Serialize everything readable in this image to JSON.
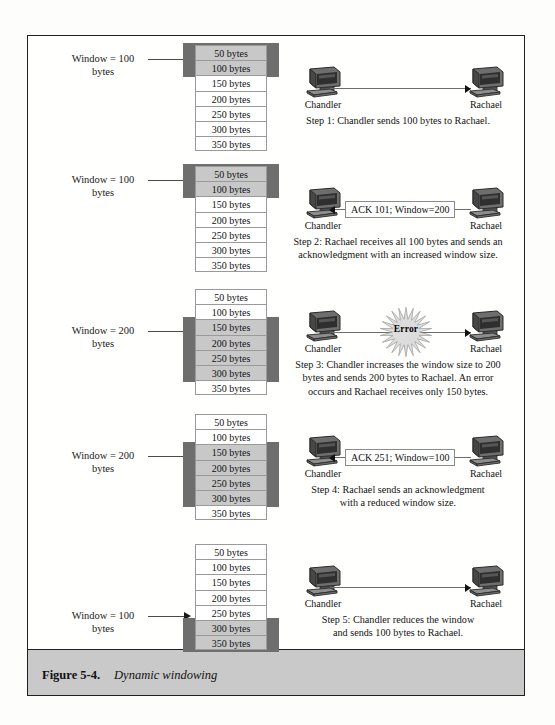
{
  "figure": {
    "number": "Figure 5-4.",
    "title": "Dynamic windowing"
  },
  "hosts": {
    "sender": "Chandler",
    "receiver": "Rachael"
  },
  "byte_cells": [
    "50 bytes",
    "100 bytes",
    "150 bytes",
    "200 bytes",
    "250 bytes",
    "300 bytes",
    "350 bytes"
  ],
  "colors": {
    "window_band": "#6e6e6e",
    "highlighted_cell": "#c8c8c8",
    "caption_band": "#c9c9c9",
    "border": "#231f20"
  },
  "steps": [
    {
      "id": 1,
      "window_label_line1": "Window = 100",
      "window_label_line2": "bytes",
      "window_bytes": 100,
      "highlight_rows": [
        1,
        2
      ],
      "direction": "right",
      "message": "",
      "error": false,
      "caption_lines": [
        "Step 1: Chandler sends 100 bytes to Rachael."
      ]
    },
    {
      "id": 2,
      "window_label_line1": "Window = 100",
      "window_label_line2": "bytes",
      "window_bytes": 100,
      "highlight_rows": [
        1,
        2
      ],
      "direction": "left",
      "message": "ACK 101; Window=200",
      "error": false,
      "caption_lines": [
        "Step 2: Rachael receives all 100 bytes and sends an",
        "acknowledgment with an increased window size."
      ]
    },
    {
      "id": 3,
      "window_label_line1": "Window = 200",
      "window_label_line2": "bytes",
      "window_bytes": 200,
      "highlight_rows": [
        3,
        4,
        5,
        6
      ],
      "direction": "right",
      "message": "",
      "error": true,
      "error_label": "Error",
      "caption_lines": [
        "Step 3: Chandler increases the window size to 200",
        "bytes and sends 200 bytes to Rachael. An error",
        "occurs and Rachael receives only 150 bytes."
      ]
    },
    {
      "id": 4,
      "window_label_line1": "Window = 200",
      "window_label_line2": "bytes",
      "window_bytes": 200,
      "highlight_rows": [
        3,
        4,
        5,
        6
      ],
      "direction": "left",
      "message": "ACK 251; Window=100",
      "error": false,
      "caption_lines": [
        "Step 4: Rachael sends an acknowledgment",
        "with a reduced window size."
      ]
    },
    {
      "id": 5,
      "window_label_line1": "Window = 100",
      "window_label_line2": "bytes",
      "window_bytes": 100,
      "highlight_rows": [
        6,
        7
      ],
      "direction": "right",
      "message": "",
      "error": false,
      "caption_lines": [
        "Step 5: Chandler reduces the window",
        "and sends 100 bytes to Rachael."
      ]
    }
  ]
}
